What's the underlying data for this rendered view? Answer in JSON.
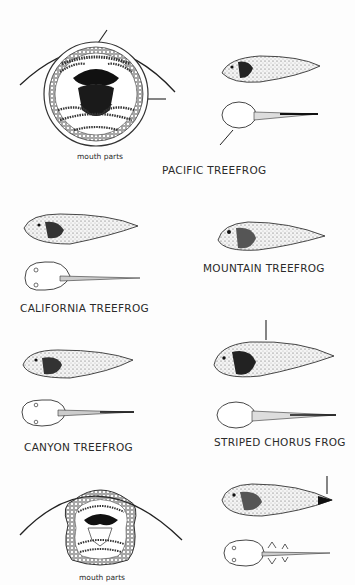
{
  "page": {
    "species": [
      {
        "id": "pacific",
        "name": "PACIFIC TREEFROG",
        "has_mouth_parts": true,
        "mouth_parts_label": "mouth parts"
      },
      {
        "id": "mountain",
        "name": "MOUNTAIN TREEFROG"
      },
      {
        "id": "california",
        "name": "CALIFORNIA TREEFROG"
      },
      {
        "id": "canyon",
        "name": "CANYON TREEFROG"
      },
      {
        "id": "striped-chorus",
        "name": "STRIPED CHORUS FROG"
      },
      {
        "id": "bottom",
        "name": "",
        "has_mouth_parts": true,
        "mouth_parts_label": "mouth parts"
      }
    ]
  }
}
